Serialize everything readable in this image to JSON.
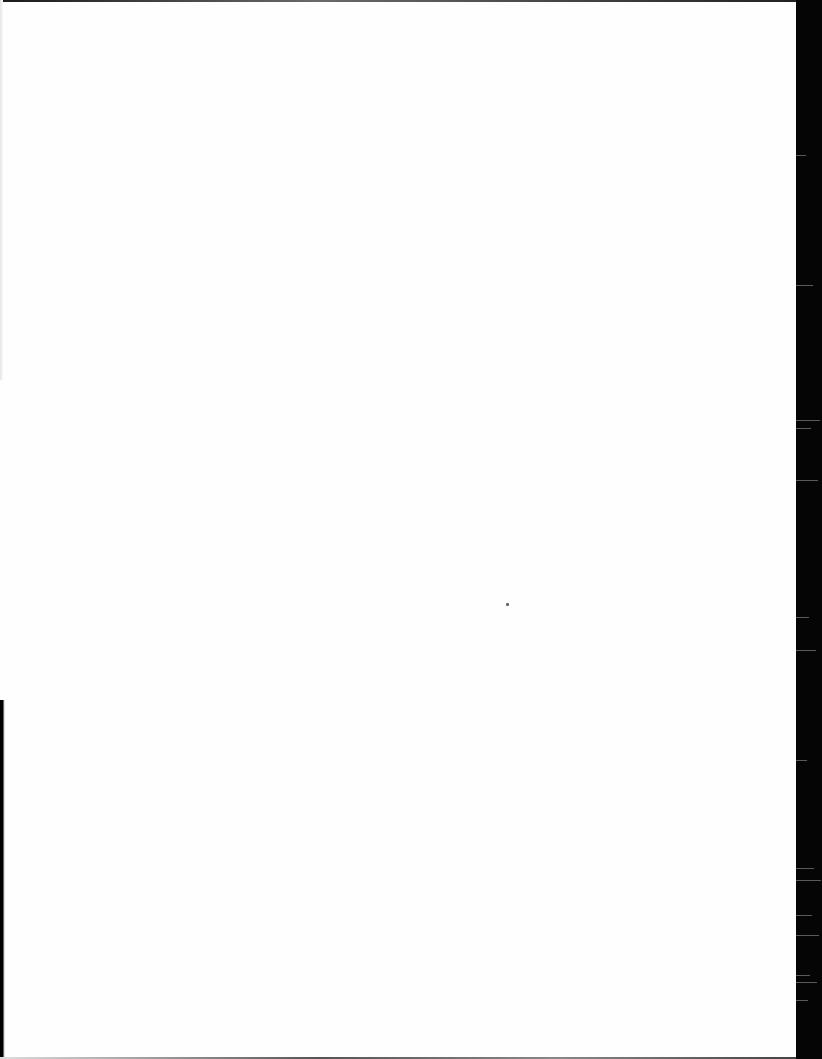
{
  "document": {
    "type": "scanned-page",
    "content": "",
    "is_blank": true
  },
  "colors": {
    "paper": "#fefefe",
    "scanner_background": "#050505",
    "speck": "#666666"
  },
  "scanner_streaks_y": [
    155,
    285,
    420,
    428,
    480,
    617,
    650,
    760,
    868,
    880,
    915,
    935,
    975,
    982,
    1000
  ]
}
